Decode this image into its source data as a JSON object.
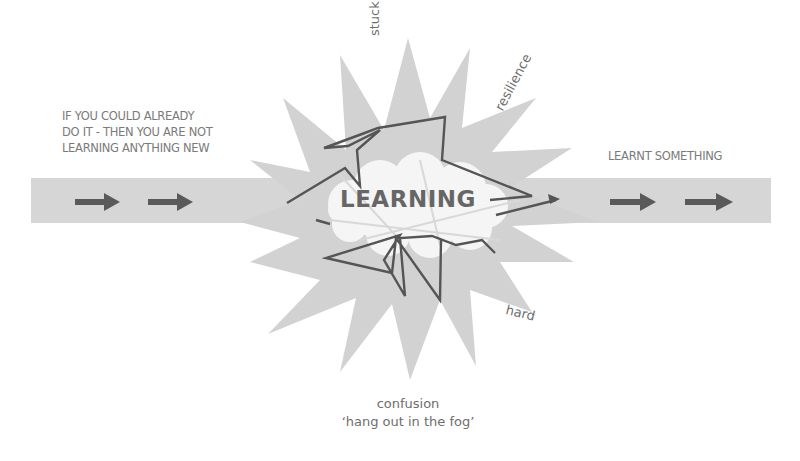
{
  "diagram": {
    "title": "LEARNING",
    "left_note": {
      "lines": [
        "IF YOU COULD ALREADY",
        "DO IT - THEN YOU ARE NOT",
        "LEARNING ANYTHING NEW"
      ]
    },
    "right_note": "LEARNT SOMETHING",
    "star_words": {
      "top": "stuck",
      "top_right": "resilience",
      "bottom_right": "hard"
    },
    "bottom_caption": {
      "line1": "confusion",
      "line2": "‘hang out in the fog’"
    },
    "colors": {
      "band": "#d6d6d6",
      "star": "#d2d2d2",
      "cloud": "#f4f4f4",
      "path": "#555555",
      "arrow": "#5a5a5a",
      "text": "#777777"
    },
    "arrows": [
      {
        "side": "left",
        "x1": 75,
        "x2": 120
      },
      {
        "side": "left",
        "x1": 148,
        "x2": 193
      },
      {
        "side": "right",
        "x1": 610,
        "x2": 656
      },
      {
        "side": "right",
        "x1": 685,
        "x2": 733
      }
    ]
  }
}
